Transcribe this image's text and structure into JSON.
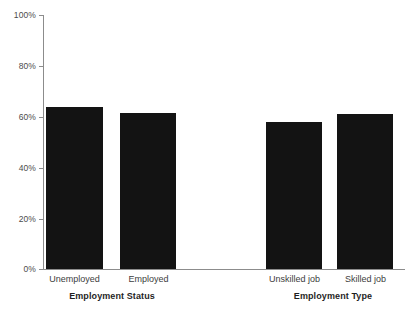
{
  "chart_data": {
    "type": "bar",
    "title": "",
    "xlabel": "",
    "ylabel": "",
    "ylim": [
      0,
      100
    ],
    "yticks": [
      "0%",
      "20%",
      "40%",
      "60%",
      "80%",
      "100%"
    ],
    "ytick_values": [
      0,
      20,
      40,
      60,
      80,
      100
    ],
    "grid": false,
    "legend": "none",
    "bar_color": "#131313",
    "axis_color": "#8c8c8c",
    "categories": [
      "Unemployed",
      "Employed",
      "Unskilled job",
      "Skilled job"
    ],
    "values": [
      64,
      61.5,
      58,
      61.3
    ],
    "groups": [
      {
        "label": "Employment Status",
        "categories": [
          "Unemployed",
          "Employed"
        ],
        "values": [
          64,
          61.5
        ]
      },
      {
        "label": "Employment Type",
        "categories": [
          "Unskilled job",
          "Skilled job"
        ],
        "values": [
          58,
          61.3
        ]
      }
    ]
  },
  "axis": {
    "tick_100": "100%",
    "tick_80": "80%",
    "tick_60": "60%",
    "tick_40": "40%",
    "tick_20": "20%",
    "tick_0": "0%"
  },
  "bars": {
    "b0": "Unemployed",
    "b1": "Employed",
    "b2": "Unskilled job",
    "b3": "Skilled job"
  },
  "groups": {
    "g0": "Employment Status",
    "g1": "Employment Type"
  }
}
